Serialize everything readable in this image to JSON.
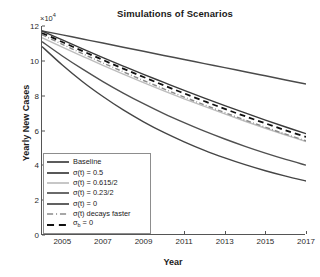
{
  "chart_data": {
    "type": "line",
    "title": "Simulations of Scenarios",
    "xlabel": "Year",
    "ylabel": "Yearly New Cases",
    "y_multiplier": "×10",
    "y_multiplier_exp": "4",
    "xlim": [
      2004,
      2017
    ],
    "ylim": [
      0,
      12
    ],
    "xticks": [
      "2005",
      "2007",
      "2009",
      "2011",
      "2013",
      "2015",
      "2017"
    ],
    "xtick_values": [
      2005,
      2007,
      2009,
      2011,
      2013,
      2015,
      2017
    ],
    "yticks": [
      "0",
      "2",
      "4",
      "6",
      "8",
      "10",
      "12"
    ],
    "ytick_values": [
      0,
      2,
      4,
      6,
      8,
      10,
      12
    ],
    "grid": false,
    "legend_position": "lower-left",
    "x": [
      2004,
      2005,
      2006,
      2007,
      2008,
      2009,
      2010,
      2011,
      2012,
      2013,
      2014,
      2015,
      2016,
      2017
    ],
    "series": [
      {
        "name": "Baseline",
        "label": "Baseline",
        "style": "solid",
        "color": "#4a4a4a",
        "width": 1.5,
        "values": [
          11.72,
          11.49,
          11.25,
          11.02,
          10.78,
          10.55,
          10.31,
          10.08,
          9.84,
          9.61,
          9.37,
          9.14,
          8.9,
          8.67
        ]
      },
      {
        "name": "sigma-0.5",
        "label": "σ(t) = 0.5",
        "style": "solid",
        "color": "#3a3a3a",
        "width": 1.4,
        "values": [
          11.72,
          11.2,
          10.69,
          10.19,
          9.7,
          9.22,
          8.76,
          8.3,
          7.86,
          7.43,
          7.01,
          6.6,
          6.2,
          5.82
        ]
      },
      {
        "name": "sigma-0.615-over-2",
        "label": "σ(t) = 0.615/2",
        "style": "solid",
        "color": "#bdbdbd",
        "width": 1.4,
        "values": [
          11.33,
          10.79,
          10.26,
          9.74,
          9.24,
          8.75,
          8.28,
          7.82,
          7.38,
          6.95,
          6.53,
          6.13,
          5.74,
          5.37
        ]
      },
      {
        "name": "sigma-0.23-over-2",
        "label": "σ(t) = 0.23/2",
        "style": "solid",
        "color": "#505050",
        "width": 1.4,
        "values": [
          11.1,
          10.28,
          9.52,
          8.81,
          8.15,
          7.54,
          6.97,
          6.45,
          5.96,
          5.51,
          5.09,
          4.7,
          4.34,
          4.01
        ]
      },
      {
        "name": "sigma-0",
        "label": "σ(t) = 0",
        "style": "solid",
        "color": "#454545",
        "width": 1.4,
        "values": [
          10.82,
          9.76,
          8.8,
          7.95,
          7.18,
          6.5,
          5.89,
          5.35,
          4.86,
          4.43,
          4.04,
          3.69,
          3.38,
          3.1
        ]
      },
      {
        "name": "sigma-decays-faster",
        "label": "σ(t) decays faster",
        "style": "dashdot",
        "color": "#8a8a8a",
        "width": 1.4,
        "values": [
          11.5,
          10.95,
          10.41,
          9.88,
          9.37,
          8.87,
          8.39,
          7.92,
          7.47,
          7.03,
          6.6,
          6.19,
          5.79,
          5.41
        ]
      },
      {
        "name": "sigma-b-zero",
        "label": "σ<sub>b</sub> = 0",
        "label_plain": "σb = 0",
        "style": "dashed",
        "color": "#111111",
        "width": 1.8,
        "values": [
          11.6,
          11.08,
          10.56,
          10.05,
          9.55,
          9.07,
          8.59,
          8.13,
          7.68,
          7.24,
          6.82,
          6.41,
          6.01,
          5.63
        ]
      }
    ]
  },
  "axes": {
    "title": "Simulations of Scenarios",
    "x_label": "Year",
    "y_label": "Yearly New Cases",
    "y_multiplier_text": "×10",
    "y_multiplier_exponent": "4"
  },
  "legend": {
    "items": [
      {
        "label": "Baseline"
      },
      {
        "label": "σ(t) = 0.5"
      },
      {
        "label": "σ(t) = 0.615/2"
      },
      {
        "label": "σ(t) = 0.23/2"
      },
      {
        "label": "σ(t) = 0"
      },
      {
        "label": "σ(t) decays faster"
      },
      {
        "label": "σb = 0"
      }
    ]
  }
}
